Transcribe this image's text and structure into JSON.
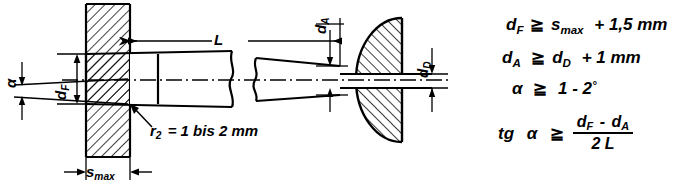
{
  "drawing": {
    "title": "Tapered pin through plate - design diagram",
    "dimensions": {
      "length": "L",
      "flange_diameter": "d_F",
      "end_diameter": "d_A",
      "head_diameter": "d_D",
      "plate_thickness": "s_max",
      "angle": "α"
    },
    "labels": {
      "L": "L",
      "dF": "d",
      "dF_sub": "F",
      "dA": "d",
      "dA_sub": "A",
      "dD": "d",
      "dD_sub": "D",
      "smax": "s",
      "smax_sub": "max",
      "alpha": "α",
      "radius_note": "r",
      "radius_note_sub": "2",
      "radius_note_rest": "= 1 bis 2 mm"
    },
    "colors": {
      "line": "#000000",
      "background": "#ffffff",
      "hatch": "#000000"
    }
  },
  "formulas": {
    "line1": {
      "lhs": "d",
      "lhs_sub": "F",
      "op": "≧",
      "rhs_main": "s",
      "rhs_sub": "max",
      "rhs_tail": "+ 1,5 mm"
    },
    "line2": {
      "lhs": "d",
      "lhs_sub": "A",
      "op": "≧",
      "rhs_main": "d",
      "rhs_sub": "D",
      "rhs_tail": "+ 1 mm"
    },
    "line3": {
      "lhs": "α",
      "op": "≧",
      "rhs": "1 - 2",
      "deg": "°"
    },
    "line4": {
      "lhs": "tg",
      "lhs_var": "α",
      "op": "≧",
      "num_a": "d",
      "num_a_sub": "F",
      "num_minus": "-",
      "num_b": "d",
      "num_b_sub": "A",
      "den": "2 L"
    }
  }
}
